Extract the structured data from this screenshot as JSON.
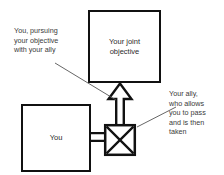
{
  "diagram": {
    "background_color": "#ffffff",
    "stroke_color": "#111111",
    "text_color": "#3a3a3a",
    "nodes": [
      {
        "id": "joint-objective",
        "shape": "square",
        "label": "Your joint\nobjective",
        "x": 88,
        "y": 10,
        "width": 73,
        "height": 73
      },
      {
        "id": "you",
        "shape": "square",
        "label": "You",
        "x": 21,
        "y": 104,
        "width": 70,
        "height": 68
      },
      {
        "id": "ally",
        "shape": "crossed-square",
        "label": "",
        "x": 104,
        "y": 124,
        "width": 32,
        "height": 32
      }
    ],
    "connectors": [
      {
        "id": "you-to-ally",
        "style": "hollow-bar",
        "from": "you",
        "to": "ally",
        "direction": "right"
      },
      {
        "id": "ally-to-joint",
        "style": "hollow-arrow",
        "from": "ally",
        "to": "joint-objective",
        "direction": "up"
      }
    ],
    "annotations": [
      {
        "id": "left-annotation",
        "text": "You, pursuing\nyour objective\nwith your ally",
        "points_to": "ally-to-joint"
      },
      {
        "id": "right-annotation",
        "text": "Your ally,\nwho allows\nyou to pass\nand is then\ntaken",
        "points_to": "ally"
      }
    ]
  }
}
